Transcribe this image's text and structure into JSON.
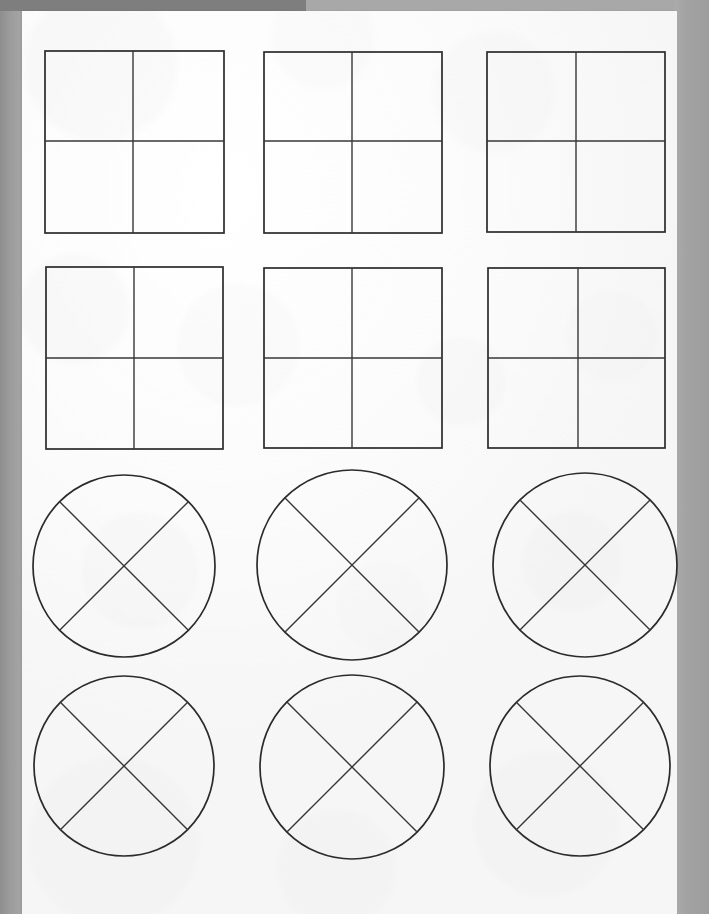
{
  "document": {
    "kind": "scanned-worksheet",
    "description": "Scanned paper worksheet showing fraction shapes divided into fourths",
    "page_background_color": "#a8a8a8",
    "paper_color": "#fbfbfb",
    "ink_color": "#2b2b2b",
    "top_shadow_color": "#7e7e7e"
  },
  "canvas": {
    "width": 709,
    "height": 914
  },
  "paper": {
    "left": 22,
    "top": 11,
    "width": 655,
    "height": 903
  },
  "shapes": {
    "rows": 4,
    "columns": 3,
    "total": 12,
    "square_count": 6,
    "circle_count": 6,
    "items": [
      {
        "id": "square-r1c1",
        "type": "square",
        "label": "square-divided-into-fourths",
        "row": 1,
        "column": 1,
        "x": 45,
        "y": 51,
        "width": 179,
        "height": 182,
        "divider_x": 133,
        "divider_y": 141,
        "parts": 4
      },
      {
        "id": "square-r1c2",
        "type": "square",
        "label": "square-divided-into-fourths",
        "row": 1,
        "column": 2,
        "x": 264,
        "y": 52,
        "width": 178,
        "height": 181,
        "divider_x": 352,
        "divider_y": 141,
        "parts": 4
      },
      {
        "id": "square-r1c3",
        "type": "square",
        "label": "square-divided-into-fourths",
        "row": 1,
        "column": 3,
        "x": 487,
        "y": 52,
        "width": 178,
        "height": 180,
        "divider_x": 576,
        "divider_y": 141,
        "parts": 4
      },
      {
        "id": "square-r2c1",
        "type": "square",
        "label": "square-divided-into-fourths",
        "row": 2,
        "column": 1,
        "x": 46,
        "y": 267,
        "width": 177,
        "height": 182,
        "divider_x": 134,
        "divider_y": 358,
        "parts": 4
      },
      {
        "id": "square-r2c2",
        "type": "square",
        "label": "square-divided-into-fourths",
        "row": 2,
        "column": 2,
        "x": 264,
        "y": 268,
        "width": 178,
        "height": 180,
        "divider_x": 352,
        "divider_y": 358,
        "parts": 4
      },
      {
        "id": "square-r2c3",
        "type": "square",
        "label": "square-divided-into-fourths",
        "row": 2,
        "column": 3,
        "x": 488,
        "y": 268,
        "width": 177,
        "height": 180,
        "divider_x": 578,
        "divider_y": 358,
        "parts": 4
      },
      {
        "id": "circle-r3c1",
        "type": "circle",
        "label": "circle-divided-into-fourths",
        "row": 3,
        "column": 1,
        "cx": 124,
        "cy": 566,
        "r": 91,
        "cross_angle_deg": 45,
        "parts": 4
      },
      {
        "id": "circle-r3c2",
        "type": "circle",
        "label": "circle-divided-into-fourths",
        "row": 3,
        "column": 2,
        "cx": 352,
        "cy": 565,
        "r": 95,
        "cross_angle_deg": 45,
        "parts": 4
      },
      {
        "id": "circle-r3c3",
        "type": "circle",
        "label": "circle-divided-into-fourths",
        "row": 3,
        "column": 3,
        "cx": 585,
        "cy": 565,
        "r": 92,
        "cross_angle_deg": 45,
        "parts": 4
      },
      {
        "id": "circle-r4c1",
        "type": "circle",
        "label": "circle-divided-into-fourths",
        "row": 4,
        "column": 1,
        "cx": 124,
        "cy": 766,
        "r": 90,
        "cross_angle_deg": 45,
        "parts": 4
      },
      {
        "id": "circle-r4c2",
        "type": "circle",
        "label": "circle-divided-into-fourths",
        "row": 4,
        "column": 2,
        "cx": 352,
        "cy": 767,
        "r": 92,
        "cross_angle_deg": 45,
        "parts": 4
      },
      {
        "id": "circle-r4c3",
        "type": "circle",
        "label": "circle-divided-into-fourths",
        "row": 4,
        "column": 3,
        "cx": 580,
        "cy": 766,
        "r": 90,
        "cross_angle_deg": 45,
        "parts": 4
      }
    ]
  }
}
